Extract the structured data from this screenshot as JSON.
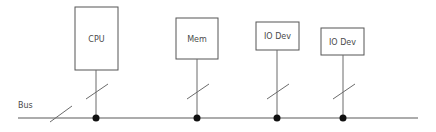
{
  "diagram": {
    "colors": {
      "background": "#ffffff",
      "box_stroke": "#555555",
      "box_fill": "#ffffff",
      "text": "#4a4a4a",
      "line": "#6b6b6b",
      "bus_line": "#5a5a5a",
      "dot": "#111111"
    },
    "bus": {
      "label": "Bus",
      "label_x": 18,
      "label_y": 105,
      "line_y": 118,
      "line_x1": 18,
      "line_x2": 418,
      "slash": {
        "x1": 50,
        "y1": 122,
        "x2": 72,
        "y2": 106
      }
    },
    "nodes": [
      {
        "label": "CPU",
        "box": {
          "x": 75,
          "y": 7,
          "w": 43,
          "h": 63
        },
        "stem": {
          "x": 96,
          "y1": 70,
          "y2": 118
        },
        "slash": {
          "x1": 86,
          "y1": 99,
          "x2": 108,
          "y2": 84
        },
        "dot": {
          "cx": 96,
          "cy": 118,
          "r": 3.5
        }
      },
      {
        "label": "Mem",
        "box": {
          "x": 176,
          "y": 18,
          "w": 42,
          "h": 41
        },
        "stem": {
          "x": 197,
          "y1": 59,
          "y2": 118
        },
        "slash": {
          "x1": 187,
          "y1": 99,
          "x2": 209,
          "y2": 84
        },
        "dot": {
          "cx": 197,
          "cy": 118,
          "r": 3.5
        }
      },
      {
        "label": "IO Dev",
        "box": {
          "x": 256,
          "y": 22,
          "w": 43,
          "h": 28
        },
        "stem": {
          "x": 277,
          "y1": 50,
          "y2": 118
        },
        "slash": {
          "x1": 267,
          "y1": 99,
          "x2": 289,
          "y2": 84
        },
        "dot": {
          "cx": 277,
          "cy": 118,
          "r": 3.5
        }
      },
      {
        "label": "IO Dev",
        "box": {
          "x": 321,
          "y": 28,
          "w": 43,
          "h": 27
        },
        "stem": {
          "x": 343,
          "y1": 55,
          "y2": 118
        },
        "slash": {
          "x1": 333,
          "y1": 99,
          "x2": 355,
          "y2": 84
        },
        "dot": {
          "cx": 343,
          "cy": 118,
          "r": 3.5
        }
      }
    ]
  }
}
